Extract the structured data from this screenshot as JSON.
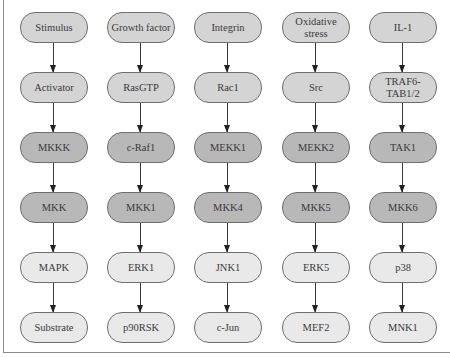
{
  "diagram": {
    "type": "signaling-pathway-cascade",
    "levels": [
      "stimulus",
      "activator",
      "MAPKKK",
      "MAPKK",
      "MAPK",
      "substrate"
    ],
    "level_colors": [
      "#d4d4d4",
      "#d4d4d4",
      "#b8b8b8",
      "#b8b8b8",
      "#e9e9e9",
      "#e9e9e9"
    ],
    "columns": [
      {
        "name": "generic",
        "nodes": [
          "Stimulus",
          "Activator",
          "MKKK",
          "MKK",
          "MAPK",
          "Substrate"
        ]
      },
      {
        "name": "erk1",
        "nodes": [
          "Growth factor",
          "RasGTP",
          "c-Raf1",
          "MKK1",
          "ERK1",
          "p90RSK"
        ]
      },
      {
        "name": "jnk1",
        "nodes": [
          "Integrin",
          "Rac1",
          "MEKK1",
          "MKK4",
          "JNK1",
          "c-Jun"
        ]
      },
      {
        "name": "erk5",
        "nodes": [
          "Oxidative stress",
          "Src",
          "MEKK2",
          "MKK5",
          "ERK5",
          "MEF2"
        ]
      },
      {
        "name": "p38",
        "nodes": [
          "IL-1",
          "TRAF6-TAB1/2",
          "TAK1",
          "MKK6",
          "p38",
          "MNK1"
        ]
      }
    ]
  }
}
